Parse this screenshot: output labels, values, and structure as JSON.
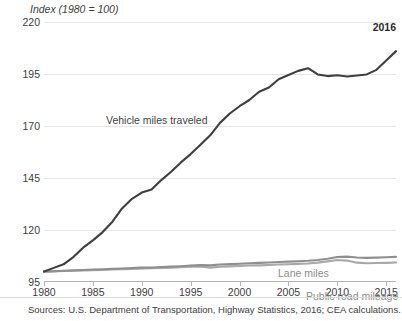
{
  "chart_data": {
    "type": "line",
    "title": "",
    "axis_title": "Index (1980 = 100)",
    "xlabel": "",
    "ylabel": "Index (1980 = 100)",
    "xlim": [
      1980,
      2016
    ],
    "ylim": [
      95,
      220
    ],
    "ytick_values": [
      95,
      120,
      145,
      170,
      195,
      220
    ],
    "ytick_labels": [
      "95",
      "120",
      "145",
      "170",
      "195",
      "220"
    ],
    "xtick_values": [
      1980,
      1985,
      1990,
      1995,
      2000,
      2005,
      2010,
      2015
    ],
    "xtick_labels": [
      "1980",
      "1985",
      "1990",
      "1995",
      "2000",
      "2005",
      "2010",
      "2015"
    ],
    "grid": true,
    "legend_position": "inline-annotations",
    "annotations": [
      {
        "text": "2016",
        "position": "top-right",
        "bold": true
      }
    ],
    "x": [
      1980,
      1981,
      1982,
      1983,
      1984,
      1985,
      1986,
      1987,
      1988,
      1989,
      1990,
      1991,
      1992,
      1993,
      1994,
      1995,
      1996,
      1997,
      1998,
      1999,
      2000,
      2001,
      2002,
      2003,
      2004,
      2005,
      2006,
      2007,
      2008,
      2009,
      2010,
      2011,
      2012,
      2013,
      2014,
      2015,
      2016
    ],
    "series": [
      {
        "name": "Vehicle miles traveled",
        "color": "#3f3f3f",
        "label_color": "#3f3f3f",
        "values": [
          100.0,
          101.8,
          103.5,
          107.0,
          111.5,
          115.0,
          119.0,
          124.0,
          130.5,
          135.0,
          138.0,
          139.5,
          144.0,
          148.0,
          152.5,
          156.5,
          161.0,
          165.5,
          171.5,
          176.0,
          179.5,
          182.5,
          186.5,
          188.5,
          192.5,
          194.5,
          196.5,
          197.8,
          194.8,
          194.0,
          194.4,
          193.8,
          194.3,
          194.8,
          197.0,
          201.5,
          206.0
        ]
      },
      {
        "name": "Lane miles",
        "color": "#8f8f8f",
        "label_color": "#8c8c8c",
        "values": [
          100.0,
          100.2,
          100.4,
          100.6,
          100.8,
          101.0,
          101.1,
          101.3,
          101.5,
          101.7,
          101.9,
          102.0,
          102.2,
          102.4,
          102.6,
          102.9,
          103.1,
          103.0,
          103.4,
          103.6,
          103.8,
          104.0,
          104.2,
          104.4,
          104.6,
          104.8,
          105.0,
          105.2,
          105.6,
          106.2,
          107.0,
          107.2,
          106.8,
          106.6,
          106.7,
          106.9,
          107.1
        ]
      },
      {
        "name": "Public road mileage",
        "color": "#a8a8a8",
        "label_color": "#8c8c8c",
        "values": [
          100.0,
          100.1,
          100.3,
          100.4,
          100.6,
          100.7,
          100.8,
          101.0,
          101.2,
          101.3,
          101.5,
          101.6,
          101.8,
          101.9,
          102.1,
          102.3,
          102.5,
          101.9,
          102.3,
          102.5,
          102.7,
          102.9,
          103.0,
          103.2,
          103.4,
          103.5,
          103.7,
          103.9,
          104.3,
          104.9,
          105.6,
          105.3,
          104.3,
          104.0,
          104.1,
          104.2,
          104.4
        ]
      }
    ]
  },
  "source_note": "Sources: U.S. Department of Transportation, Highway Statistics, 2016; CEA calculations.",
  "colors": {
    "gridline": "#e6e6e6",
    "axis": "#b4b4b4",
    "text": "#3d3d3d",
    "vmt": "#3f3f3f",
    "lane_miles": "#8f8f8f",
    "public_road": "#a8a8a8"
  }
}
